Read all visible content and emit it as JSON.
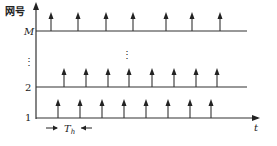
{
  "diagram": {
    "y_axis_label": "网号",
    "x_axis_label": "t",
    "period_label": "T",
    "period_subscript": "h",
    "rows": [
      {
        "label": "M",
        "y": 31,
        "line_end": 247,
        "arrows_x": [
          51,
          78,
          106,
          133,
          166,
          192,
          220
        ]
      },
      {
        "label": "2",
        "y": 87,
        "line_end": 247,
        "arrows_x": [
          64,
          86,
          108,
          129,
          152,
          174,
          196,
          217
        ]
      },
      {
        "label": "1",
        "y": 118,
        "line_end": 258,
        "arrows_x": [
          58,
          80,
          102,
          124,
          146,
          168,
          190,
          211
        ]
      }
    ],
    "ellipsis": "⋮",
    "colors": {
      "line": "#333333",
      "text": "#222222"
    }
  }
}
